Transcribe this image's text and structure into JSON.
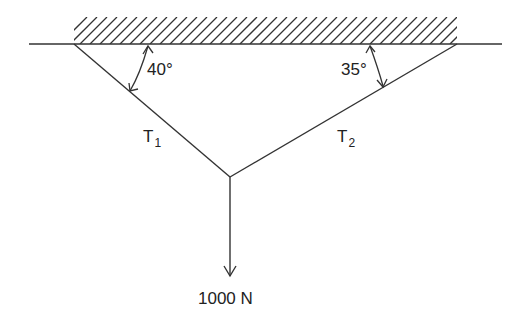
{
  "diagram": {
    "type": "statics free-body / cable tension diagram",
    "support": {
      "label": "ceiling (hatched fixed support)"
    },
    "angles": {
      "left": "40°",
      "right": "35°"
    },
    "cables": {
      "left": {
        "label": "T",
        "subscript": "1"
      },
      "right": {
        "label": "T",
        "subscript": "2"
      }
    },
    "load": {
      "label": "1000 N"
    },
    "colors": {
      "line": "#333333",
      "background": "#ffffff"
    }
  }
}
